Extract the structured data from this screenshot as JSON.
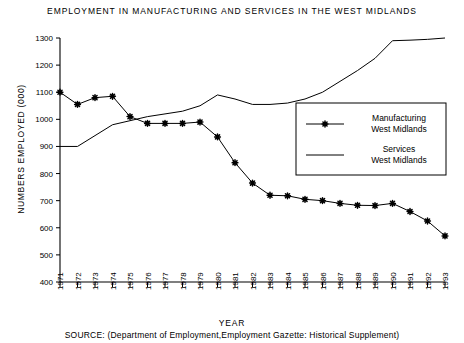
{
  "chart_data": {
    "type": "line",
    "title": "EMPLOYMENT IN MANUFACTURING AND SERVICES IN THE WEST MIDLANDS",
    "xlabel": "YEAR",
    "ylabel": "NUMBERS EMPLOYED (000)",
    "source": "SOURCE: (Department of Employment,Employment Gazette: Historical Supplement)",
    "grid": false,
    "legend_position": "center-right",
    "ylim": [
      400,
      1300
    ],
    "yticks": [
      400,
      500,
      600,
      700,
      800,
      900,
      1000,
      1100,
      1200,
      1300
    ],
    "categories": [
      "1971",
      "1972",
      "1973",
      "1974",
      "1975",
      "1976",
      "1977",
      "1978",
      "1979",
      "1980",
      "1981",
      "1982",
      "1983",
      "1984",
      "1985",
      "1986",
      "1987",
      "1988",
      "1989",
      "1990",
      "1991",
      "1992",
      "1993"
    ],
    "series": [
      {
        "name": "Manufacturing West Midlands",
        "legend_label_line1": "Manufacturing",
        "legend_label_line2": "West Midlands",
        "marker": "star",
        "color": "#000000",
        "values": [
          1100,
          1055,
          1080,
          1085,
          1010,
          985,
          985,
          985,
          990,
          935,
          840,
          765,
          720,
          718,
          705,
          700,
          690,
          683,
          682,
          690,
          660,
          625,
          570
        ]
      },
      {
        "name": "Services West Midlands",
        "legend_label_line1": "Services",
        "legend_label_line2": "West Midlands",
        "marker": "none",
        "color": "#000000",
        "values": [
          900,
          900,
          940,
          980,
          995,
          1010,
          1020,
          1030,
          1050,
          1090,
          1075,
          1055,
          1055,
          1060,
          1075,
          1100,
          1140,
          1180,
          1225,
          1290,
          1292,
          1295,
          1300
        ]
      }
    ]
  },
  "axis": {
    "y_min_label": "400",
    "y_max_label": "1300"
  }
}
